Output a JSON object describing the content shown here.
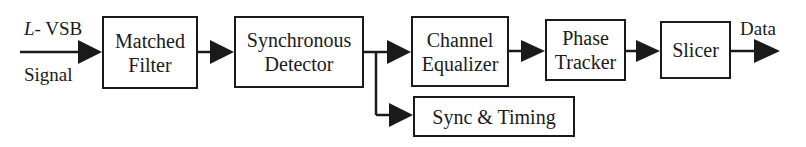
{
  "diagram": {
    "input": {
      "line1_italic": "L-",
      "line1_rest": " VSB",
      "line2": "Signal"
    },
    "output": {
      "label": "Data"
    },
    "blocks": [
      {
        "id": "matched-filter",
        "lines": [
          "Matched",
          "Filter"
        ]
      },
      {
        "id": "synchronous-detector",
        "lines": [
          "Synchronous",
          "Detector"
        ]
      },
      {
        "id": "channel-equalizer",
        "lines": [
          "Channel",
          "Equalizer"
        ]
      },
      {
        "id": "phase-tracker",
        "lines": [
          "Phase",
          "Tracker"
        ]
      },
      {
        "id": "slicer",
        "lines": [
          "Slicer"
        ]
      },
      {
        "id": "sync-timing",
        "lines": [
          "Sync & Timing"
        ]
      }
    ],
    "edges": [
      {
        "from": "input",
        "to": "matched-filter"
      },
      {
        "from": "matched-filter",
        "to": "synchronous-detector"
      },
      {
        "from": "synchronous-detector",
        "to": "channel-equalizer"
      },
      {
        "from": "synchronous-detector",
        "to": "sync-timing"
      },
      {
        "from": "channel-equalizer",
        "to": "phase-tracker"
      },
      {
        "from": "phase-tracker",
        "to": "slicer"
      },
      {
        "from": "slicer",
        "to": "output"
      }
    ],
    "colors": {
      "stroke": "#1a1a1a",
      "background": "#ffffff"
    }
  }
}
